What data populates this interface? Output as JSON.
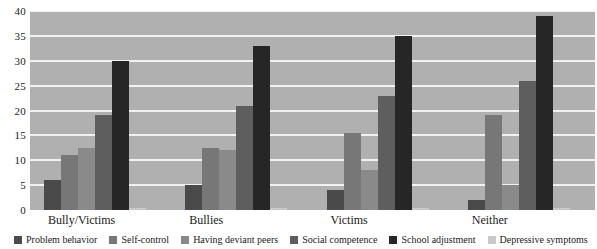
{
  "chart_data": {
    "type": "bar",
    "title": "",
    "subtitle": "",
    "xlabel": "",
    "ylabel": "",
    "ylim": [
      0,
      40
    ],
    "ytick_step": 5,
    "yticks": [
      "40",
      "35",
      "30",
      "25",
      "20",
      "15",
      "10",
      "5",
      "0"
    ],
    "grid": true,
    "legend_position": "bottom",
    "plot_background": "#b0b0b0",
    "gridline_color": "#f2f2f2",
    "categories": [
      "Bully/Victims",
      "Bullies",
      "Victims",
      "Neither"
    ],
    "series": [
      {
        "name": "Problem behavior",
        "color": "#4a4a4a",
        "values": [
          6,
          5,
          4,
          2
        ]
      },
      {
        "name": "Self-control",
        "color": "#777777",
        "values": [
          11,
          12.5,
          15.5,
          19
        ]
      },
      {
        "name": "Having deviant peers",
        "color": "#8a8a8a",
        "values": [
          12.5,
          12,
          8,
          5
        ]
      },
      {
        "name": "Social competence",
        "color": "#5e5e5e",
        "values": [
          19,
          21,
          23,
          26
        ]
      },
      {
        "name": "School adjustment",
        "color": "#262626",
        "values": [
          30,
          33,
          35,
          39
        ]
      },
      {
        "name": "Depressive symptoms",
        "color": "#c9c9c9",
        "values": [
          0.4,
          0.4,
          0.4,
          0.4
        ]
      }
    ]
  }
}
